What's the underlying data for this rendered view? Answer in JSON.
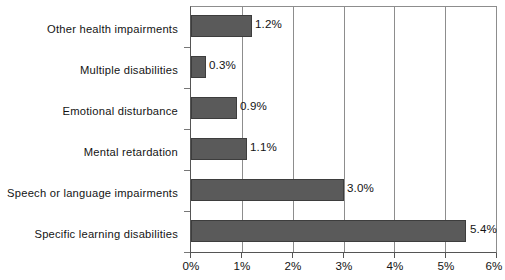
{
  "chart_data": {
    "type": "bar",
    "orientation": "horizontal",
    "title": "",
    "subtitle": "",
    "xlabel": "",
    "ylabel": "",
    "categories": [
      "Other health impairments",
      "Multiple disabilities",
      "Emotional disturbance",
      "Mental retardation",
      "Speech or language impairments",
      "Specific learning disabilities"
    ],
    "values": [
      1.2,
      0.3,
      0.9,
      1.1,
      3.0,
      5.4
    ],
    "value_labels": [
      "1.2%",
      "0.3%",
      "0.9%",
      "1.1%",
      "3.0%",
      "5.4%"
    ],
    "xlim": [
      0,
      6
    ],
    "xticks": [
      0,
      1,
      2,
      3,
      4,
      5,
      6
    ],
    "xtick_labels": [
      "0%",
      "1%",
      "2%",
      "3%",
      "4%",
      "5%",
      "6%"
    ],
    "grid": true,
    "grid_axis": "x",
    "legend": false,
    "bar_color": "#5a5a5a",
    "bar_edge_color": "#3d3d3d",
    "grid_color": "#8d8d8d",
    "axis_color": "#555555",
    "text_color": "#141414",
    "background": "#ffffff"
  }
}
